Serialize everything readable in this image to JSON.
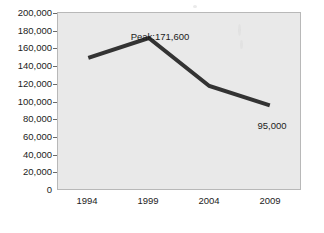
{
  "chart_data": {
    "type": "line",
    "title": "",
    "subtitle": "",
    "xlabel": "",
    "ylabel": "",
    "categories": [
      "1994",
      "1999",
      "2004",
      "2009"
    ],
    "values": [
      149000,
      171600,
      117000,
      95000
    ],
    "series": [
      {
        "name": "",
        "values": [
          149000,
          171600,
          117000,
          95000
        ]
      }
    ],
    "ylim": [
      0,
      200000
    ],
    "ytick_step": 20000,
    "ytick_labels": [
      "200,000",
      "180,000",
      "160,000",
      "140,000",
      "120,000",
      "100,000",
      "80,000",
      "60,000",
      "40,000",
      "20,000",
      "0"
    ],
    "ytick_values": [
      200000,
      180000,
      160000,
      140000,
      120000,
      100000,
      80000,
      60000,
      40000,
      20000,
      0
    ],
    "xtick_labels": [
      "1994",
      "1999",
      "2004",
      "2009"
    ],
    "grid": false,
    "legend": false,
    "legend_position": "none",
    "annotations": [
      {
        "text": "Peak:171,600",
        "value": 171600,
        "category": "1999",
        "position": "above-point"
      },
      {
        "text": "95,000",
        "value": 95000,
        "category": "2009",
        "position": "below-point"
      }
    ],
    "colors": {
      "line": "#333333",
      "plot_background": "#e9e9e9",
      "figure_background": "#ffffff",
      "axis": "#6a6a6a",
      "border": "#b8b8b8",
      "text": "#1c1c1c"
    },
    "line_width_px": 4
  }
}
